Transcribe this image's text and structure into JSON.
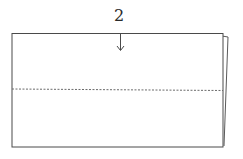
{
  "diagram": {
    "type": "origami-fold-step",
    "step_label": "2",
    "elements": {
      "paper": "rectangle (front layer) with a slightly offset back layer on the right",
      "fold_line": "valley fold (dashed) across the horizontal middle",
      "arrow": "downward arrow indicating fold direction from top edge"
    },
    "colors": {
      "line": "#4a4a4a",
      "dashed": "#6a6a6a",
      "background": "#ffffff"
    }
  }
}
